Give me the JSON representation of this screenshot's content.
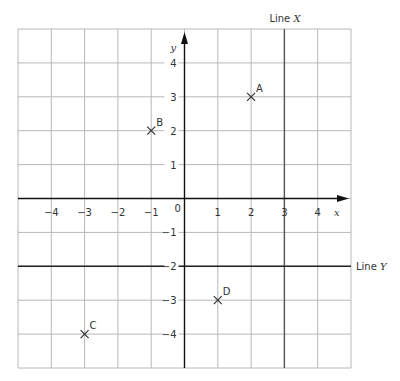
{
  "chart_data": {
    "type": "scatter",
    "title": "",
    "xlabel": "x",
    "ylabel": "y",
    "xlim": [
      -5,
      5
    ],
    "ylim": [
      -5,
      5
    ],
    "grid": true,
    "x_ticks": [
      -4,
      -3,
      -2,
      -1,
      1,
      2,
      3,
      4
    ],
    "y_ticks": [
      4,
      3,
      2,
      1,
      -1,
      -2,
      -3,
      -4
    ],
    "origin_label": "0",
    "points": [
      {
        "label": "A",
        "x": 2,
        "y": 3
      },
      {
        "label": "B",
        "x": -1,
        "y": 2
      },
      {
        "label": "C",
        "x": -3,
        "y": -4
      },
      {
        "label": "D",
        "x": 1,
        "y": -3
      }
    ],
    "lines": [
      {
        "label": "Line X",
        "equation": "x = 3",
        "orientation": "vertical"
      },
      {
        "label": "Line Y",
        "equation": "y = -2",
        "orientation": "horizontal"
      }
    ]
  },
  "labels": {
    "x_axis": "x",
    "y_axis": "y",
    "origin": "0",
    "line_x": "Line X",
    "line_y": "Line Y"
  },
  "colors": {
    "grid": "#b8b8b8",
    "axis": "#111111",
    "text": "#333333"
  }
}
